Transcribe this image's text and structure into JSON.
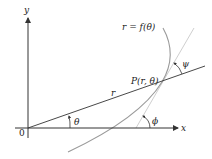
{
  "diagram": {
    "labels": {
      "y_axis": "y",
      "x_axis": "x",
      "origin": "0",
      "curve": "r = f(θ)",
      "point": "P(r, θ)",
      "radius": "r",
      "theta": "θ",
      "phi": "ϕ",
      "psi": "ψ"
    },
    "colors": {
      "axes": "#333333",
      "radius_line": "#333333",
      "curve": "#999999",
      "tangent": "#cccccc",
      "text": "#222222"
    }
  }
}
